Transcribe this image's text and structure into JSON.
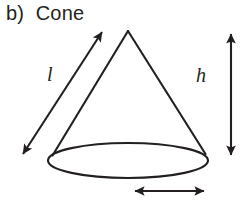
{
  "figure": {
    "title": "b)  Cone",
    "part_letter": "b)",
    "shape_name": "Cone",
    "stroke_color": "#231f20",
    "background_color": "#ffffff",
    "labels": {
      "slant_height": "l",
      "height": "h",
      "radius": ""
    },
    "icons": {
      "slant_arrow": "double-headed-diagonal-arrow-icon",
      "height_arrow": "double-headed-vertical-arrow-icon",
      "radius_arrow": "double-headed-horizontal-arrow-icon",
      "cone_outline": "cone-shape-icon"
    },
    "geometry": {
      "apex": [
        128,
        31
      ],
      "base_ellipse_center": [
        128,
        160
      ],
      "base_ellipse_rx": 80,
      "base_ellipse_ry": 17,
      "base_left_contact": [
        52,
        154
      ],
      "base_right_contact": [
        205,
        153
      ],
      "slant_arrow_from": [
        22,
        155
      ],
      "slant_arrow_to": [
        103,
        31
      ],
      "height_arrow_x": 231,
      "height_arrow_top": 32,
      "height_arrow_bottom": 157,
      "radius_arrow_y": 191,
      "radius_arrow_left": 133,
      "radius_arrow_right": 206
    }
  }
}
